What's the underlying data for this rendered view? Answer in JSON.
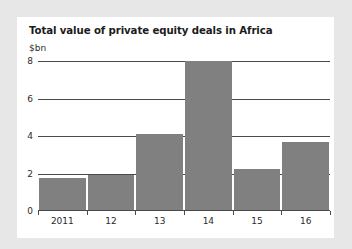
{
  "chart_data": {
    "type": "bar",
    "title": "Total value of private equity deals in Africa",
    "unit_label": "$bn",
    "xlabel": "",
    "ylabel": "$bn",
    "categories": [
      "2011",
      "12",
      "13",
      "14",
      "15",
      "16"
    ],
    "values": [
      1.7,
      1.85,
      4.05,
      7.95,
      2.2,
      3.65
    ],
    "ylim": [
      0,
      8
    ],
    "yticks": [
      0,
      2,
      4,
      6,
      8
    ],
    "ytick_labels": [
      "0",
      "2",
      "4",
      "6",
      "8"
    ],
    "grid": "horizontal",
    "legend": "none",
    "bar_color": "#808080",
    "axis_color": "#4a4a4a",
    "background_color": "#ffffff",
    "page_background_color": "#e7e7e7"
  }
}
